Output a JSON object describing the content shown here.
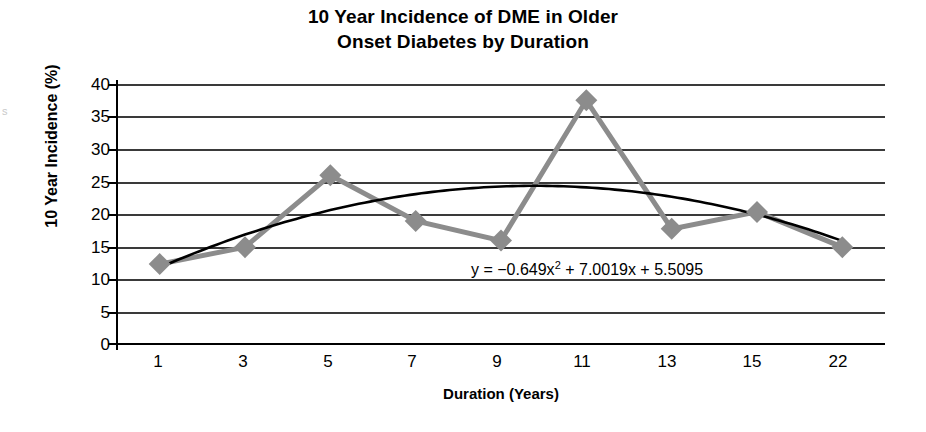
{
  "chart_data": {
    "type": "line",
    "title": "10 Year Incidence of DME in Older Onset Diabetes by Duration",
    "title_line1": "10 Year Incidence of DME in Older",
    "title_line2": "Onset Diabetes by Duration",
    "xlabel": "Duration (Years)",
    "ylabel": "10 Year Incidence (%)",
    "categories": [
      "1",
      "3",
      "5",
      "7",
      "9",
      "11",
      "13",
      "15",
      "22"
    ],
    "values": [
      12.4,
      15.0,
      26.0,
      19.0,
      16.0,
      37.5,
      17.8,
      20.4,
      15.0
    ],
    "series": [
      {
        "name": "10 Year Incidence",
        "values": [
          12.4,
          15.0,
          26.0,
          19.0,
          16.0,
          37.5,
          17.8,
          20.4,
          15.0
        ],
        "color": "#8c8c8c",
        "marker": "diamond"
      },
      {
        "name": "Polynomial trendline",
        "color": "#000000",
        "equation": "y = −0.649x² + 7.0019x + 5.5095",
        "fit_values": [
          11.9,
          18.5,
          23.9,
          24.2,
          21.9,
          16.1,
          16.1,
          16.1,
          15.0
        ]
      }
    ],
    "trend_equation_prefix": "y = −0.649x",
    "trend_equation_exponent": "2",
    "trend_equation_suffix": " + 7.0019x + 5.5095",
    "ylim": [
      0,
      40
    ],
    "ytick_values": [
      "40",
      "35",
      "30",
      "25",
      "20",
      "15",
      "10",
      "5",
      "0"
    ],
    "ytick_numbers": [
      40,
      35,
      30,
      25,
      20,
      15,
      10,
      5,
      0
    ],
    "grid": true,
    "grid_axis": "y",
    "legend": "none",
    "legend_position": "none",
    "colors": {
      "series_gray": "#8c8c8c",
      "trend_black": "#000000",
      "gridline": "#3a3a3a",
      "axis": "#000000",
      "background": "#ffffff"
    }
  },
  "edge_artifact": "s"
}
